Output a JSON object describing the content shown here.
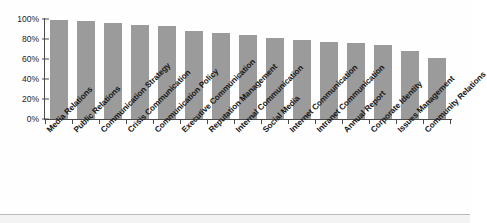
{
  "chart_data": {
    "type": "bar",
    "title": "",
    "xlabel": "",
    "ylabel": "",
    "ylim": [
      0,
      100
    ],
    "ytick_labels": [
      "100%",
      "80%",
      "60%",
      "40%",
      "20%",
      "0%"
    ],
    "ytick_values": [
      100,
      80,
      60,
      40,
      20,
      0
    ],
    "grid": false,
    "legend": "none",
    "bar_color": "#9b9b9b",
    "axis_color": "#4a4a4a",
    "categories": [
      "Media Relations",
      "Public Relations",
      "Communication Strategy",
      "Crisis Communication",
      "Communication Policy",
      "Executive Communication",
      "Reputation Management",
      "Internal Communication",
      "Social Media",
      "Internet Communication",
      "Intranet Communication",
      "Annual Report",
      "Corporate Identity",
      "Issues Management",
      "Community Relations"
    ],
    "values": [
      99,
      98,
      96,
      94,
      93,
      88,
      86,
      84,
      81,
      79,
      77,
      76,
      74,
      68,
      61
    ]
  }
}
